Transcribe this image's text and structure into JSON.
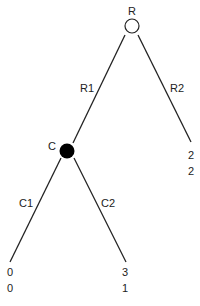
{
  "diagram": {
    "type": "game-tree",
    "nodes": {
      "root": {
        "label": "R",
        "style": "open"
      },
      "chance": {
        "label": "C",
        "style": "filled"
      }
    },
    "edges": {
      "r1": "R1",
      "r2": "R2",
      "c1": "C1",
      "c2": "C2"
    },
    "payoffs": {
      "r2_leaf": [
        "2",
        "2"
      ],
      "c1_leaf": [
        "0",
        "0"
      ],
      "c2_leaf": [
        "3",
        "1"
      ]
    }
  }
}
